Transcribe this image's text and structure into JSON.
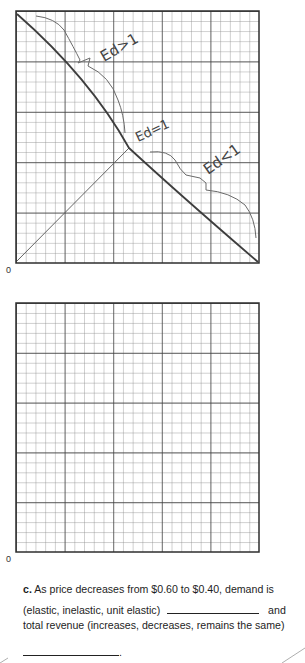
{
  "graphs": [
    {
      "id": "graph-1",
      "origin_label": "0",
      "grid": {
        "major_cols": 5,
        "major_rows": 5,
        "minor_per_major": 5
      },
      "annotations": [
        {
          "text": "Ed>1",
          "meaning": "elastic region (upper)"
        },
        {
          "text": "Ed=1",
          "meaning": "unit elastic (midpoint)"
        },
        {
          "text": "Ed<1",
          "meaning": "inelastic region (lower)"
        }
      ]
    },
    {
      "id": "graph-2",
      "origin_label": "0",
      "grid": {
        "major_cols": 5,
        "major_rows": 5,
        "minor_per_major": 5
      }
    }
  ],
  "question": {
    "letter": "c.",
    "line1": "As price decreases from $0.60 to $0.40, demand is",
    "line2_prefix": "(elastic, inelastic, unit elastic)",
    "line2_suffix": "and",
    "line3": "total revenue (increases, decreases, remains the same)",
    "line4_suffix": "."
  },
  "colors": {
    "grid_major": "#3a3a3a",
    "grid_minor": "#8a8a8a",
    "ink": "#3d3d3d",
    "pencil": "#6a6a6a"
  }
}
